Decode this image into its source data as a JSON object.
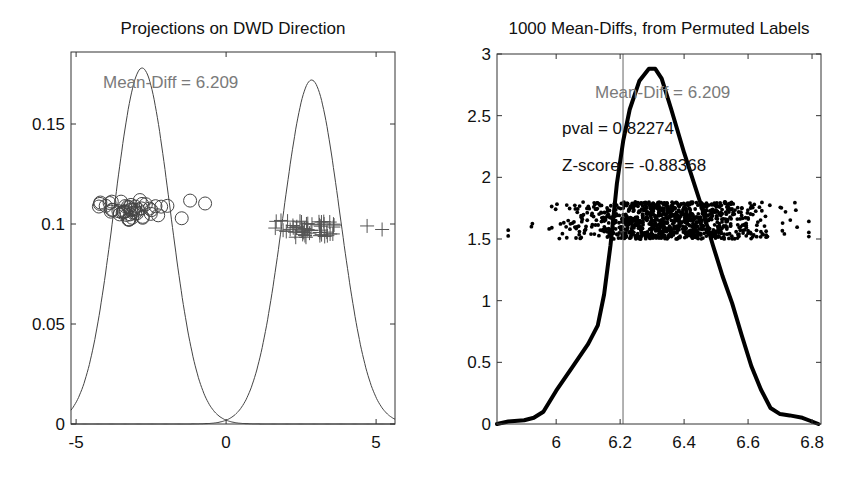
{
  "chart_data": [
    {
      "type": "line",
      "title": "Projections on DWD Direction",
      "xlabel": "",
      "ylabel": "",
      "xlim": [
        -5.17,
        5.63
      ],
      "ylim": [
        0,
        0.186
      ],
      "xticks": [
        -5,
        0,
        5
      ],
      "xtick_labels": [
        "-5",
        "0",
        "5"
      ],
      "yticks": [
        0,
        0.05,
        0.1,
        0.15
      ],
      "ytick_labels": [
        "0",
        "0.05",
        "0.1",
        "0.15"
      ],
      "grid": false,
      "annotations": [
        {
          "text": "Mean-Diff = 6.209",
          "x": -3.4,
          "y": 0.169,
          "color": "#7a7a7a"
        }
      ],
      "series": [
        {
          "name": "class-1-density",
          "kind": "gaussian-curve",
          "mean": -2.8,
          "sd": 0.93,
          "peak": 0.178,
          "color": "#444444"
        },
        {
          "name": "class-2-density",
          "kind": "gaussian-curve",
          "mean": 2.85,
          "sd": 0.95,
          "peak": 0.172,
          "color": "#444444"
        },
        {
          "name": "class-1-projections",
          "kind": "scatter",
          "marker": "circle",
          "x_range": [
            -4.6,
            -0.7
          ],
          "y_jitter": [
            0.102,
            0.112
          ],
          "count": 50,
          "color": "#444444"
        },
        {
          "name": "class-2-projections",
          "kind": "scatter",
          "marker": "plus",
          "x_range": [
            1.6,
            5.2
          ],
          "y_jitter": [
            0.093,
            0.102
          ],
          "count": 50,
          "color": "#555555"
        }
      ]
    },
    {
      "type": "line",
      "title": "1000 Mean-Diffs, from Permuted Labels",
      "xlabel": "",
      "ylabel": "",
      "xlim": [
        5.815,
        6.828
      ],
      "ylim": [
        0,
        3
      ],
      "xticks": [
        6,
        6.2,
        6.4,
        6.6,
        6.8
      ],
      "xtick_labels": [
        "6",
        "6.2",
        "6.4",
        "6.6",
        "6.8"
      ],
      "yticks": [
        0,
        0.5,
        1,
        1.5,
        2,
        2.5,
        3
      ],
      "ytick_labels": [
        "0",
        "0.5",
        "1",
        "1.5",
        "2",
        "2.5",
        "3"
      ],
      "grid": false,
      "vline": {
        "x": 6.209,
        "color": "#666666"
      },
      "annotations": [
        {
          "text": "Mean-Diff = 6.209",
          "x": 6.27,
          "y": 2.7,
          "color": "#7a7a7a"
        },
        {
          "text": "pval = 0.82274",
          "x": 6.0,
          "y": 2.3,
          "color": "#111111"
        },
        {
          "text": "Z-score = -0.88368",
          "x": 6.0,
          "y": 1.97,
          "color": "#111111"
        }
      ],
      "series": [
        {
          "name": "permutation-kde",
          "kind": "line",
          "color": "#000000",
          "x": [
            5.815,
            5.85,
            5.9,
            5.93,
            5.96,
            6.0,
            6.05,
            6.1,
            6.13,
            6.15,
            6.17,
            6.19,
            6.21,
            6.23,
            6.26,
            6.29,
            6.31,
            6.33,
            6.36,
            6.4,
            6.45,
            6.49,
            6.52,
            6.55,
            6.58,
            6.61,
            6.64,
            6.67,
            6.7,
            6.73,
            6.77,
            6.8,
            6.82
          ],
          "y": [
            0.0,
            0.02,
            0.03,
            0.05,
            0.1,
            0.27,
            0.46,
            0.65,
            0.8,
            1.05,
            1.45,
            1.95,
            2.3,
            2.55,
            2.78,
            2.88,
            2.88,
            2.8,
            2.55,
            2.2,
            1.8,
            1.45,
            1.2,
            0.98,
            0.72,
            0.47,
            0.28,
            0.13,
            0.08,
            0.07,
            0.05,
            0.02,
            0.0
          ]
        },
        {
          "name": "permuted-mean-diffs",
          "kind": "scatter",
          "marker": "dot",
          "count": 1000,
          "x_range": [
            5.85,
            6.79
          ],
          "dense_range": [
            6.12,
            6.62
          ],
          "y_jitter": [
            1.5,
            1.8
          ],
          "color": "#000000"
        }
      ]
    }
  ]
}
